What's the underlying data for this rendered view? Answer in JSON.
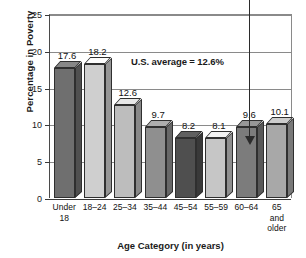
{
  "chart_data": {
    "type": "bar",
    "title": "",
    "xlabel": "Age Category (in years)",
    "ylabel": "Percentage in Poverty",
    "categories": [
      "Under 18",
      "18–24",
      "25–34",
      "35–44",
      "45–54",
      "55–59",
      "60–64",
      "65 and older"
    ],
    "category_lines": [
      [
        "Under",
        "18"
      ],
      [
        "18–24"
      ],
      [
        "25–34"
      ],
      [
        "35–44"
      ],
      [
        "45–54"
      ],
      [
        "55–59"
      ],
      [
        "60–64"
      ],
      [
        "65",
        "and",
        "older"
      ]
    ],
    "values": [
      17.6,
      18.2,
      12.6,
      9.7,
      8.2,
      8.1,
      9.6,
      10.1
    ],
    "value_labels": [
      "17.6",
      "18.2",
      "12.6",
      "9.7",
      "8.2",
      "8.1",
      "9.6",
      "10.1"
    ],
    "bar_colors": [
      "#6f6f6f",
      "#cfcfcf",
      "#bdbdbd",
      "#8f8f8f",
      "#4f4f4f",
      "#c6c6c6",
      "#7c7c7c",
      "#a8a8a8"
    ],
    "ylim": [
      0,
      25
    ],
    "yticks": [
      0,
      5,
      10,
      15,
      20,
      25
    ],
    "ytick_labels": [
      "0",
      "5",
      "10",
      "15",
      "20",
      "25"
    ],
    "grid": true,
    "legend": "none",
    "annotations": [
      {
        "name": "us-average-note",
        "text": "U.S. average = 12.6%"
      },
      {
        "name": "pointer-arrow",
        "text": "",
        "points_to": "60–64"
      }
    ]
  }
}
